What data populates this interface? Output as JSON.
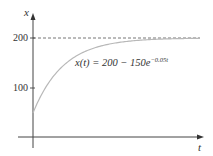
{
  "chart_data": {
    "type": "line",
    "title": "",
    "xlabel": "t",
    "ylabel": "x",
    "yticks": [
      100,
      200
    ],
    "ytick_labels": [
      "100",
      "200"
    ],
    "xticks": [],
    "ylim": [
      0,
      200
    ],
    "xlim": [
      0,
      110
    ],
    "grid": false,
    "legend": null,
    "annotations": [
      {
        "text": "x(t) = 200 − 150e^{−0.05t}",
        "position": "center-upper"
      }
    ],
    "reference_lines": [
      {
        "type": "horizontal",
        "y": 200,
        "style": "dashed"
      }
    ],
    "series": [
      {
        "name": "x(t) = 200 - 150e^(-0.05t)",
        "function": "200 - 150*exp(-0.05*t)",
        "x": [
          0,
          5,
          10,
          15,
          20,
          30,
          40,
          50,
          60,
          80,
          100
        ],
        "values": [
          50,
          83.2,
          109.0,
          128.9,
          144.8,
          166.5,
          179.7,
          187.7,
          192.5,
          197.3,
          199.0
        ]
      }
    ]
  },
  "labels": {
    "y_axis": "x",
    "x_axis": "t",
    "tick_200": "200",
    "tick_100": "100",
    "formula_main": "x(t) = 200 − 150",
    "formula_e": "e",
    "formula_exp": "−0.05t"
  },
  "colors": {
    "axis": "#444444",
    "curve": "#b8b8b8",
    "dashed": "#666666",
    "text": "#333333"
  }
}
